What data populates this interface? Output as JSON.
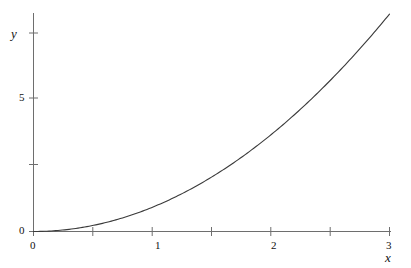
{
  "figure": {
    "background_color": "#ffffff",
    "line_color": "#3a3a3a",
    "axis_color": "#6e6e6e"
  },
  "axes": {
    "x_label": "x",
    "y_label": "y",
    "x_ticks": [
      {
        "value": 0,
        "label": "0"
      },
      {
        "value": 0.5,
        "label": ""
      },
      {
        "value": 1,
        "label": "1"
      },
      {
        "value": 1.5,
        "label": ""
      },
      {
        "value": 2,
        "label": "2"
      },
      {
        "value": 2.5,
        "label": ""
      },
      {
        "value": 3,
        "label": "3"
      }
    ],
    "y_ticks": [
      {
        "value": 0,
        "label": "0"
      },
      {
        "value": 2.5,
        "label": ""
      },
      {
        "value": 5,
        "label": "5"
      },
      {
        "value": 7.5,
        "label": ""
      }
    ]
  },
  "chart_data": {
    "type": "line",
    "title": "",
    "xlabel": "x",
    "ylabel": "y",
    "xlim": [
      0,
      3
    ],
    "ylim": [
      0,
      8.2
    ],
    "grid": false,
    "legend": "none",
    "series": [
      {
        "name": "curve",
        "x": [
          0,
          0.15,
          0.3,
          0.45,
          0.6,
          0.75,
          0.9,
          1.05,
          1.2,
          1.35,
          1.5,
          1.65,
          1.8,
          1.95,
          2.1,
          2.25,
          2.4,
          2.55,
          2.7,
          2.85,
          3
        ],
        "y": [
          0,
          0.02,
          0.08,
          0.18,
          0.33,
          0.51,
          0.73,
          1,
          1.31,
          1.65,
          2.04,
          2.47,
          2.94,
          3.45,
          4,
          4.59,
          5.22,
          5.9,
          6.61,
          7.36,
          8.16
        ]
      }
    ]
  }
}
